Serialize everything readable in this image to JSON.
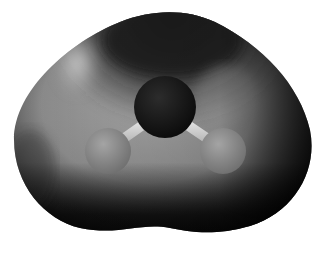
{
  "figure": {
    "molecule": {
      "atoms": [
        {
          "element": "O",
          "cx": 165,
          "cy": 107,
          "r": 31,
          "color": "#151515"
        },
        {
          "element": "H",
          "cx": 108,
          "cy": 151,
          "r": 23,
          "color": "#8a8a8a"
        },
        {
          "element": "H",
          "cx": 223,
          "cy": 151,
          "r": 23,
          "color": "#8a8a8a"
        }
      ],
      "bonds": [
        {
          "from": 0,
          "to": 1,
          "color": "#d6d6d6"
        },
        {
          "from": 0,
          "to": 2,
          "color": "#d6d6d6"
        }
      ]
    },
    "surface": {
      "highlight_color": "#d8d8d8",
      "mid_color": "#8e8e8e",
      "shadow_color": "#0c0c0c",
      "background": "#ffffff"
    }
  }
}
